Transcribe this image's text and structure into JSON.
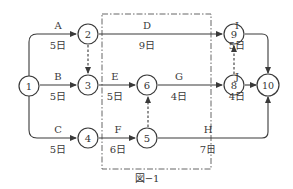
{
  "diagram": {
    "type": "activity-on-arrow network",
    "caption": "図−1",
    "nodes": [
      {
        "id": "1",
        "label": "1"
      },
      {
        "id": "2",
        "label": "2"
      },
      {
        "id": "3",
        "label": "3"
      },
      {
        "id": "4",
        "label": "4"
      },
      {
        "id": "5",
        "label": "5"
      },
      {
        "id": "6",
        "label": "6"
      },
      {
        "id": "8",
        "label": "8"
      },
      {
        "id": "9",
        "label": "9"
      },
      {
        "id": "10",
        "label": "10"
      }
    ],
    "activities": [
      {
        "name": "A",
        "from": "1",
        "to": "2",
        "duration": "5日"
      },
      {
        "name": "B",
        "from": "1",
        "to": "3",
        "duration": "5日"
      },
      {
        "name": "C",
        "from": "1",
        "to": "4",
        "duration": "5日"
      },
      {
        "name": "D",
        "from": "2",
        "to": "9",
        "duration": "9日"
      },
      {
        "name": "E",
        "from": "3",
        "to": "6",
        "duration": "5日"
      },
      {
        "name": "F",
        "from": "4",
        "to": "5",
        "duration": "6日"
      },
      {
        "name": "G",
        "from": "6",
        "to": "8",
        "duration": "4日"
      },
      {
        "name": "H",
        "from": "5",
        "to": "10",
        "duration": "7日"
      },
      {
        "name": "I",
        "from": "9",
        "to": "10",
        "duration": "5日"
      },
      {
        "name": "J",
        "from": "8",
        "to": "10",
        "duration": "4日"
      }
    ],
    "dummies": [
      {
        "from": "2",
        "to": "3"
      },
      {
        "from": "5",
        "to": "6"
      },
      {
        "from": "8",
        "to": "9"
      }
    ]
  }
}
